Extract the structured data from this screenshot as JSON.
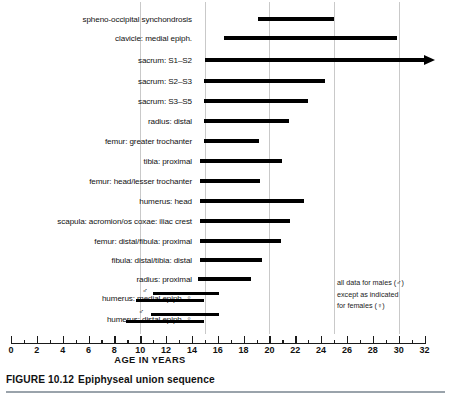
{
  "figure": {
    "caption_number": "FIGURE 10.12",
    "caption_text": "Epiphyseal union sequence",
    "corner_code": ""
  },
  "axis": {
    "title": "AGE IN YEARS",
    "min": 0,
    "max": 32,
    "major_step": 2,
    "minor_step": 1,
    "tick_labels": [
      "0",
      "2",
      "4",
      "6",
      "8",
      "10",
      "12",
      "14",
      "16",
      "18",
      "20",
      "22",
      "24",
      "26",
      "28",
      "30",
      "32"
    ],
    "gridlines": [
      10,
      15,
      20,
      25,
      30
    ]
  },
  "note": {
    "line1": "all data for males (♂)",
    "line2": "except as indicated",
    "line3": "for females (♀)"
  },
  "chart_data": {
    "type": "bar",
    "orientation": "horizontal",
    "title": "Epiphyseal union sequence",
    "xlabel": "AGE IN YEARS",
    "ylabel": "",
    "xlim": [
      0,
      32
    ],
    "grid": true,
    "legend": "all data for males except as indicated for females",
    "categories": [
      "spheno-occipital synchondrosis",
      "clavicle: medial epiph.",
      "sacrum: S1–S2",
      "sacrum: S2–S3",
      "sacrum:  S3–S5",
      "radius: distal",
      "femur: greater trochanter",
      "tibia: proximal",
      "femur: head/lesser trochanter",
      "humerus: head",
      "scapula: acromion/os coxae: iliac crest",
      "femur: distal/fibula: proximal",
      "fibula: distal/tibia: distal",
      "radius: proximal",
      "humerus: medial epiph.",
      "humerus: distal epiph."
    ],
    "ranges": [
      {
        "label": "spheno-occipital synchondrosis",
        "start": 19.1,
        "end": 25.0,
        "sex": "male",
        "open_ended": false
      },
      {
        "label": "clavicle: medial epiph.",
        "start": 16.5,
        "end": 29.9,
        "sex": "male",
        "open_ended": false
      },
      {
        "label": "sacrum: S1–S2",
        "start": 15.0,
        "end": 32.0,
        "sex": "male",
        "open_ended": true
      },
      {
        "label": "sacrum: S2–S3",
        "start": 14.9,
        "end": 24.3,
        "sex": "male",
        "open_ended": false
      },
      {
        "label": "sacrum:  S3–S5",
        "start": 14.9,
        "end": 23.0,
        "sex": "male",
        "open_ended": false
      },
      {
        "label": "radius: distal",
        "start": 14.9,
        "end": 21.5,
        "sex": "male",
        "open_ended": false
      },
      {
        "label": "femur: greater trochanter",
        "start": 14.9,
        "end": 19.2,
        "sex": "male",
        "open_ended": false
      },
      {
        "label": "tibia: proximal",
        "start": 14.6,
        "end": 21.0,
        "sex": "male",
        "open_ended": false
      },
      {
        "label": "femur: head/lesser trochanter",
        "start": 14.6,
        "end": 19.3,
        "sex": "male",
        "open_ended": false
      },
      {
        "label": "humerus: head",
        "start": 14.6,
        "end": 22.7,
        "sex": "male",
        "open_ended": false
      },
      {
        "label": "scapula: acromion/os coxae: iliac crest",
        "start": 14.6,
        "end": 21.6,
        "sex": "male",
        "open_ended": false
      },
      {
        "label": "femur: distal/fibula: proximal",
        "start": 14.6,
        "end": 20.9,
        "sex": "male",
        "open_ended": false
      },
      {
        "label": "fibula: distal/tibia: distal",
        "start": 14.6,
        "end": 19.4,
        "sex": "male",
        "open_ended": false
      },
      {
        "label": "radius: proximal",
        "start": 14.5,
        "end": 18.6,
        "sex": "male",
        "open_ended": false
      },
      {
        "label": "humerus: medial epiph.",
        "start": 11.0,
        "end": 16.1,
        "sex": "male",
        "open_ended": false
      },
      {
        "label": "humerus: medial epiph.",
        "start": 9.7,
        "end": 14.9,
        "sex": "female",
        "open_ended": false
      },
      {
        "label": "humerus: distal epiph.",
        "start": 10.8,
        "end": 16.1,
        "sex": "male",
        "open_ended": false
      },
      {
        "label": "humerus: distal epiph.",
        "start": 8.9,
        "end": 14.9,
        "sex": "female",
        "open_ended": false
      }
    ]
  },
  "rows": [
    {
      "label": "spheno-occipital synchondrosis",
      "y": 14,
      "bars": [
        {
          "start": 19.1,
          "end": 25.0
        }
      ],
      "marks": []
    },
    {
      "label": "clavicle: medial epiph.",
      "y": 33,
      "bars": [
        {
          "start": 16.5,
          "end": 29.9
        }
      ],
      "marks": []
    },
    {
      "label": "sacrum: S1–S2",
      "y": 55,
      "bars": [
        {
          "start": 15.0,
          "end": 32.0,
          "arrow": true
        }
      ],
      "marks": []
    },
    {
      "label": "sacrum: S2–S3",
      "y": 76,
      "bars": [
        {
          "start": 14.9,
          "end": 24.3
        }
      ],
      "marks": []
    },
    {
      "label": "sacrum:  S3–S5",
      "y": 96,
      "bars": [
        {
          "start": 14.9,
          "end": 23.0
        }
      ],
      "marks": []
    },
    {
      "label": "radius: distal",
      "y": 116,
      "bars": [
        {
          "start": 14.9,
          "end": 21.5
        }
      ],
      "marks": []
    },
    {
      "label": "femur: greater trochanter",
      "y": 136,
      "bars": [
        {
          "start": 14.9,
          "end": 19.2
        }
      ],
      "marks": []
    },
    {
      "label": "tibia: proximal",
      "y": 156,
      "bars": [
        {
          "start": 14.6,
          "end": 21.0
        }
      ],
      "marks": []
    },
    {
      "label": "femur: head/lesser trochanter",
      "y": 176,
      "bars": [
        {
          "start": 14.6,
          "end": 19.3
        }
      ],
      "marks": []
    },
    {
      "label": "humerus: head",
      "y": 196,
      "bars": [
        {
          "start": 14.6,
          "end": 22.7
        }
      ],
      "marks": []
    },
    {
      "label": "scapula: acromion/os coxae: iliac crest",
      "y": 216,
      "bars": [
        {
          "start": 14.6,
          "end": 21.6
        }
      ],
      "marks": []
    },
    {
      "label": "femur: distal/fibula: proximal",
      "y": 236,
      "bars": [
        {
          "start": 14.6,
          "end": 20.9
        }
      ],
      "marks": []
    },
    {
      "label": "fibula: distal/tibia: distal",
      "y": 255,
      "bars": [
        {
          "start": 14.6,
          "end": 19.4
        }
      ],
      "marks": []
    },
    {
      "label": "radius: proximal",
      "y": 274,
      "bars": [
        {
          "start": 14.5,
          "end": 18.6
        }
      ],
      "marks": []
    },
    {
      "label": "humerus: medial epiph. ♀",
      "y": 293,
      "bars": [
        {
          "start": 11.0,
          "end": 16.1,
          "dy": -4
        },
        {
          "start": 9.7,
          "end": 14.9,
          "dy": 3
        }
      ],
      "marks": [
        {
          "sym": "♂",
          "x": 10.7,
          "dy": -11
        }
      ]
    },
    {
      "label": "humerus: distal epiph. ♀",
      "y": 314,
      "bars": [
        {
          "start": 10.8,
          "end": 16.1,
          "dy": -4
        },
        {
          "start": 8.9,
          "end": 14.9,
          "dy": 3
        }
      ],
      "marks": [
        {
          "sym": "♂",
          "x": 10.4,
          "dy": -11
        }
      ]
    }
  ]
}
